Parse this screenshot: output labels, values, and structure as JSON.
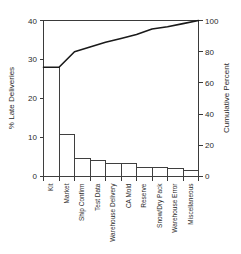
{
  "chart_data": {
    "type": "bar",
    "title": "",
    "subtitle": "",
    "xlabel": "",
    "ylabel": "% Late Deliveries",
    "y2label": "Cumulative Percent",
    "ylim": [
      0,
      40
    ],
    "y2lim": [
      0,
      100
    ],
    "grid": false,
    "legend": "none",
    "categories": [
      "Kit",
      "Market",
      "Ship Confirm",
      "Test Data",
      "Warehouse Delivery",
      "CA Mold",
      "Reserve",
      "Snow/Dry Pack",
      "Warehouse Error",
      "Miscellaneous"
    ],
    "values": [
      28.0,
      10.7,
      4.6,
      4.1,
      3.3,
      3.4,
      2.3,
      2.3,
      2.0,
      1.6
    ],
    "series": [
      {
        "name": "% Late Deliveries",
        "type": "bar",
        "axis": "left",
        "values": [
          28.0,
          10.7,
          4.6,
          4.1,
          3.3,
          3.4,
          2.3,
          2.3,
          2.0,
          1.6
        ]
      },
      {
        "name": "Cumulative Percent",
        "type": "line",
        "axis": "right",
        "values": [
          70.0,
          80.0,
          83.0,
          86.0,
          88.5,
          91.0,
          94.5,
          96.0,
          98.0,
          100.0
        ]
      }
    ],
    "y_ticks": [
      0,
      10,
      20,
      30,
      40
    ],
    "y2_ticks": [
      0,
      20,
      40,
      60,
      80,
      100
    ],
    "colors": {
      "bar_fill": "#ffffff",
      "bar_stroke": "#3f3f3f",
      "line": "#1a1a1a",
      "axis": "#3a3a3a",
      "text": "#2b2b2b",
      "background": "#ffffff"
    }
  }
}
